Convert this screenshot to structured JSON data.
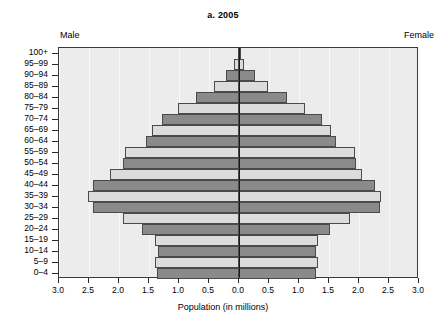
{
  "chart": {
    "title": "a. 2005",
    "left_label": "Male",
    "right_label": "Female",
    "xtitle": "Population (in millions)"
  },
  "chart_data": {
    "type": "bar",
    "subtype": "population-pyramid",
    "title": "a. 2005",
    "xlabel": "Population (in millions)",
    "ylabel": "",
    "xlim": [
      -3.0,
      3.0
    ],
    "xticks": [
      3.0,
      2.5,
      2.0,
      1.5,
      1.0,
      0.5,
      0.0,
      0.5,
      1.0,
      1.5,
      2.0,
      2.5,
      3.0
    ],
    "xtick_labels": [
      "3.0",
      "2.5",
      "2.0",
      "1.5",
      "1.0",
      "0.5",
      "0.0",
      "0.5",
      "1.0",
      "1.5",
      "2.0",
      "2.5",
      "3.0"
    ],
    "grid": true,
    "legend": false,
    "annotations": [
      "Male",
      "Female"
    ],
    "categories": [
      "100+",
      "95–99",
      "90–94",
      "85–89",
      "80–84",
      "75–79",
      "70–74",
      "65–69",
      "60–64",
      "55–59",
      "50–54",
      "45–49",
      "40–44",
      "35–39",
      "30–34",
      "25–29",
      "20–24",
      "15–19",
      "10–14",
      "5–9",
      "0–4"
    ],
    "series": [
      {
        "name": "Male",
        "side": "left",
        "values": [
          0.02,
          0.09,
          0.22,
          0.42,
          0.72,
          1.02,
          1.28,
          1.45,
          1.55,
          1.9,
          1.93,
          2.15,
          2.44,
          2.52,
          2.44,
          1.93,
          1.62,
          1.4,
          1.35,
          1.4,
          1.36
        ]
      },
      {
        "name": "Female",
        "side": "right",
        "values": [
          0.02,
          0.09,
          0.26,
          0.48,
          0.8,
          1.1,
          1.38,
          1.53,
          1.62,
          1.93,
          1.95,
          2.05,
          2.26,
          2.37,
          2.35,
          1.85,
          1.52,
          1.32,
          1.28,
          1.32,
          1.29
        ]
      }
    ],
    "bar_shading": [
      "dark",
      "light",
      "dark",
      "light",
      "dark",
      "light",
      "dark",
      "light",
      "dark",
      "light",
      "dark",
      "light",
      "dark",
      "light",
      "dark",
      "light",
      "dark",
      "light",
      "dark",
      "light",
      "dark"
    ],
    "colors": {
      "dark_bar": "#8a8a8a",
      "light_bar": "#dcdcdc",
      "plot_background": "#ececec",
      "axis": "#1a1a1a"
    }
  }
}
